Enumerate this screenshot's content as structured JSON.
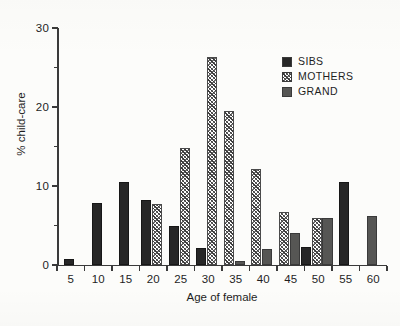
{
  "chart_data": {
    "type": "bar",
    "title": "",
    "xlabel": "Age of female",
    "ylabel": "% child-care",
    "categories": [
      "5",
      "10",
      "15",
      "20",
      "25",
      "30",
      "35",
      "40",
      "45",
      "50",
      "55",
      "60"
    ],
    "series": [
      {
        "name": "SIBS",
        "key": "sibs",
        "values": [
          0.8,
          7.9,
          10.5,
          8.2,
          4.9,
          2.2,
          0,
          0,
          0,
          2.3,
          10.5,
          0
        ]
      },
      {
        "name": "MOTHERS",
        "key": "mothers",
        "values": [
          0,
          0,
          0,
          7.7,
          14.8,
          26.3,
          19.5,
          12.2,
          6.7,
          5.9,
          0,
          0
        ]
      },
      {
        "name": "GRAND",
        "key": "grand",
        "values": [
          0,
          0,
          0,
          0,
          0,
          0,
          0.5,
          2.0,
          4.0,
          5.9,
          0,
          6.2
        ]
      }
    ],
    "ylim": [
      0,
      30
    ],
    "yticks_major": [
      0,
      10,
      20,
      30
    ],
    "yticks_minor": [
      5,
      15,
      25
    ],
    "ytick_labels": [
      "0",
      "10",
      "20",
      "30"
    ],
    "xtick_labels": [
      "5",
      "10",
      "15",
      "20",
      "25",
      "30",
      "35",
      "40",
      "45",
      "50",
      "55",
      "60"
    ],
    "grid": false,
    "legend_position": "top-right"
  },
  "legend": {
    "entries": [
      {
        "label": "SIBS",
        "swatch": "solid-dark",
        "color": "#272727"
      },
      {
        "label": "MOTHERS",
        "swatch": "hatched",
        "color": "#3c3c3c"
      },
      {
        "label": "GRAND",
        "swatch": "solid-gray",
        "color": "#565654"
      }
    ]
  },
  "axes": {
    "x_title": "Age of female",
    "y_title": "% child-care"
  },
  "colors": {
    "sibs": "#272727",
    "mothers": "#3c3c3c",
    "grand": "#565654",
    "axis": "#3a3a3a",
    "background": "#fcfcfa"
  }
}
